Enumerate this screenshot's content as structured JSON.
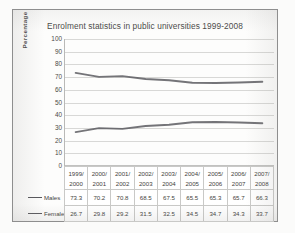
{
  "chart_data": {
    "type": "line",
    "title": "Enrolment statistics in public universities 1999-2008",
    "xlabel": "",
    "ylabel": "Percentage",
    "ylim": [
      0,
      100
    ],
    "ytick_step": 10,
    "yticks": [
      100,
      90,
      80,
      70,
      60,
      50,
      40,
      30,
      20,
      10,
      0
    ],
    "grid": "horizontal",
    "legend_position": "data-table-row-headers",
    "categories": [
      "1999/2000",
      "2000/2001",
      "2001/2002",
      "2002/2003",
      "2003/2004",
      "2004/2005",
      "2005/2006",
      "2006/2007",
      "2007/2008"
    ],
    "categories_line1": [
      "1999/",
      "2000/",
      "2001/",
      "2002/",
      "2003/",
      "2004/",
      "2005/",
      "2006/",
      "2007/"
    ],
    "categories_line2": [
      "2000",
      "2001",
      "2002",
      "2003",
      "2004",
      "2005",
      "2006",
      "2007",
      "2008"
    ],
    "series": [
      {
        "name": "Males",
        "color": "#56565a",
        "values": [
          73.3,
          70.2,
          70.8,
          68.5,
          67.5,
          65.5,
          65.3,
          65.7,
          66.3
        ]
      },
      {
        "name": "Females",
        "color": "#56565a",
        "values": [
          26.7,
          29.8,
          29.2,
          31.5,
          32.5,
          34.5,
          34.7,
          34.3,
          33.7
        ]
      }
    ]
  },
  "colors": {
    "frame": "#8e8e8e",
    "gridline": "#d8d8d6",
    "axis": "#b9b9b7",
    "text": "#4a4a48",
    "table_border": "#c9c9c7",
    "series_line": "#56565a"
  }
}
